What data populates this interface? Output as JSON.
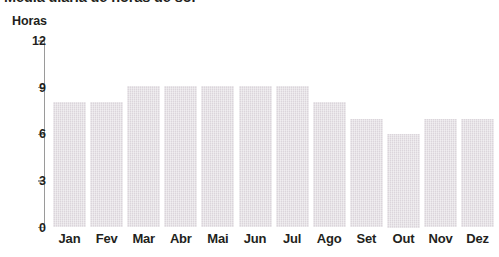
{
  "title": {
    "text": "Média diária de horas de sol",
    "cropped": true
  },
  "axis_caption": "Horas",
  "chart_data": {
    "type": "bar",
    "title": "Média diária de horas de sol",
    "xlabel": "",
    "ylabel": "Horas",
    "ylim": [
      0,
      12
    ],
    "yticks": [
      0,
      3,
      6,
      9,
      12
    ],
    "ytick_labels": [
      "0",
      "3",
      "6",
      "9",
      "12"
    ],
    "grid": false,
    "legend": "none",
    "bar_color": "#dbd5db",
    "axis_color": "#9a9a9a",
    "categories": [
      "Jan",
      "Fev",
      "Mar",
      "Abr",
      "Mai",
      "Jun",
      "Jul",
      "Ago",
      "Set",
      "Out",
      "Nov",
      "Dez"
    ],
    "values": [
      8.1,
      8.1,
      9.1,
      9.1,
      9.1,
      9.1,
      9.1,
      8.1,
      7.0,
      6.0,
      7.0,
      7.0
    ]
  }
}
